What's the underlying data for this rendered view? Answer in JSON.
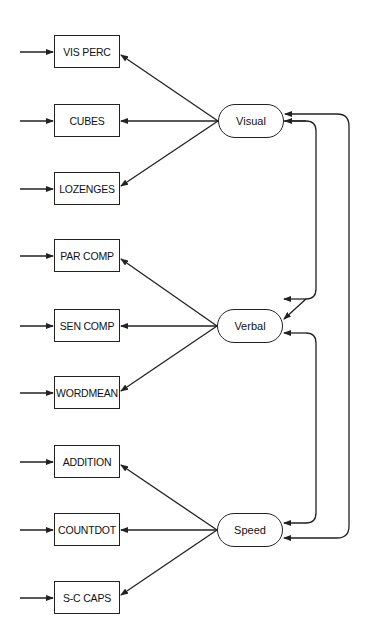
{
  "diagram": {
    "type": "confirmatory factor analysis path diagram",
    "factors": [
      {
        "id": "visual",
        "label": "Visual",
        "indicators": [
          "VIS PERC",
          "CUBES",
          "LOZENGES"
        ]
      },
      {
        "id": "verbal",
        "label": "Verbal",
        "indicators": [
          "PAR COMP",
          "SEN COMP",
          "WORDMEAN"
        ]
      },
      {
        "id": "speed",
        "label": "Speed",
        "indicators": [
          "ADDITION",
          "COUNTDOT",
          "S-C CAPS"
        ]
      }
    ],
    "observed": [
      {
        "label": "VIS PERC",
        "factor": "Visual"
      },
      {
        "label": "CUBES",
        "factor": "Visual"
      },
      {
        "label": "LOZENGES",
        "factor": "Visual"
      },
      {
        "label": "PAR COMP",
        "factor": "Verbal"
      },
      {
        "label": "SEN COMP",
        "factor": "Verbal"
      },
      {
        "label": "WORDMEAN",
        "factor": "Verbal"
      },
      {
        "label": "ADDITION",
        "factor": "Speed"
      },
      {
        "label": "COUNTDOT",
        "factor": "Speed"
      },
      {
        "label": "S-C CAPS",
        "factor": "Speed"
      }
    ],
    "covariances": [
      {
        "from": "Visual",
        "to": "Verbal"
      },
      {
        "from": "Verbal",
        "to": "Speed"
      },
      {
        "from": "Visual",
        "to": "Speed"
      }
    ],
    "error_arrows": 9
  }
}
